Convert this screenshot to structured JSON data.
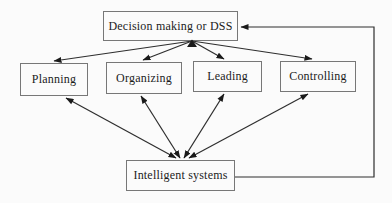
{
  "diagram": {
    "nodes": {
      "dss": {
        "label": "Decision making or DSS"
      },
      "planning": {
        "label": "Planning"
      },
      "organizing": {
        "label": "Organizing"
      },
      "leading": {
        "label": "Leading"
      },
      "controlling": {
        "label": "Controlling"
      },
      "intelligent": {
        "label": "Intelligent systems"
      }
    },
    "edges": [
      {
        "from": "dss",
        "to": "planning",
        "direction": "both"
      },
      {
        "from": "dss",
        "to": "organizing",
        "direction": "both"
      },
      {
        "from": "dss",
        "to": "leading",
        "direction": "both"
      },
      {
        "from": "dss",
        "to": "controlling",
        "direction": "both"
      },
      {
        "from": "intelligent",
        "to": "planning",
        "direction": "both"
      },
      {
        "from": "intelligent",
        "to": "organizing",
        "direction": "both"
      },
      {
        "from": "intelligent",
        "to": "leading",
        "direction": "both"
      },
      {
        "from": "intelligent",
        "to": "controlling",
        "direction": "both"
      },
      {
        "from": "intelligent",
        "to": "dss",
        "direction": "one-way",
        "route": "right-side feedback loop"
      }
    ],
    "colors": {
      "line": "#2e2e2e",
      "arrowhead": "#1a1a1a",
      "box_border": "#777777",
      "text": "#1b1b1b",
      "background": "#fbfbfb"
    }
  }
}
